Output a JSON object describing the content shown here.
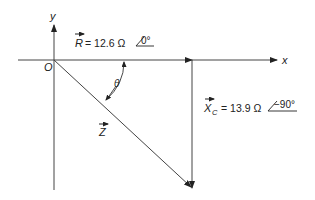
{
  "diagram": {
    "type": "phasor-diagram",
    "axes": {
      "x_label": "x",
      "y_label": "y",
      "origin_label": "O"
    },
    "vectors": [
      {
        "id": "R",
        "symbol": "R",
        "subscript": "",
        "magnitude": "12.6",
        "unit": "Ω",
        "angle": "0°",
        "direction": "along +x"
      },
      {
        "id": "XC",
        "symbol": "X",
        "subscript": "C",
        "magnitude": "13.9",
        "unit": "Ω",
        "angle": "−90°",
        "direction": "downward from tip of R"
      },
      {
        "id": "Z",
        "symbol": "Z",
        "subscript": "",
        "direction": "resultant from origin to tip of XC"
      }
    ],
    "angle_label": "θ",
    "labels": {
      "r_eq": "= 12.6 Ω",
      "r_angle": "0°",
      "xc_eq": "= 13.9 Ω",
      "xc_angle": "−90°"
    }
  }
}
